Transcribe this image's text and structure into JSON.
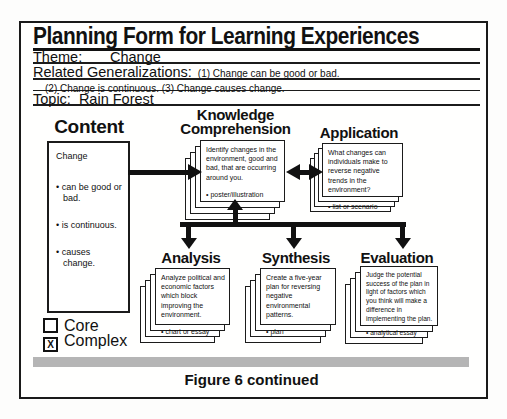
{
  "header": {
    "title": "Planning Form for Learning Experiences",
    "theme_label": "Theme:",
    "theme_value": "Change",
    "generalizations_label": "Related Generalizations:",
    "generalization_1": "(1)  Change can be good or bad.",
    "generalizations_line2": "(2)  Change is continuous.  (3)  Change causes change.",
    "topic_label": "Topic:",
    "topic_value": "Rain Forest"
  },
  "diagram": {
    "content": {
      "heading": "Content",
      "box_title": "Change",
      "bullets": [
        "• can be good or bad.",
        "• is continuous.",
        "• causes change."
      ]
    },
    "levels": [
      {
        "id": "knowledge-comprehension",
        "heading_line1": "Knowledge",
        "heading_line2": "Comprehension",
        "text": "Identify changes in the environment, good and bad, that are occurring around you.",
        "bullet": "• poster/illustration"
      },
      {
        "id": "application",
        "heading": "Application",
        "text": "What changes can individuals make to reverse negative trends in the environment?",
        "bullet": "• list or scenario"
      },
      {
        "id": "analysis",
        "heading": "Analysis",
        "text": "Analyze political and economic factors which block improving the environment.",
        "bullet": "• chart or essay"
      },
      {
        "id": "synthesis",
        "heading": "Synthesis",
        "text": "Create a five-year plan for reversing negative environmental patterns.",
        "bullet": "• plan"
      },
      {
        "id": "evaluation",
        "heading": "Evaluation",
        "text": "Judge the potential success of the plan in light of factors which you think will make a difference in implementing the plan.",
        "bullet": "• analytical essay"
      }
    ],
    "legend": {
      "core_label": "Core",
      "core_mark": "",
      "complex_label": "Complex",
      "complex_mark": "X"
    }
  },
  "footer": {
    "caption": "Figure 6 continued"
  },
  "colors": {
    "ink": "#111111",
    "paper": "#ffffff",
    "divider_bar": "#b5b5b5"
  }
}
